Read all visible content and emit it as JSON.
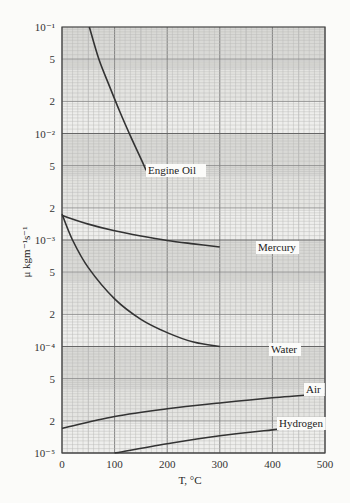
{
  "chart_data": {
    "type": "line",
    "title": "",
    "xlabel": "T, °C",
    "ylabel": "μ kgm⁻¹s⁻¹",
    "xscale": "linear",
    "yscale": "log",
    "xlim": [
      0,
      500
    ],
    "ylim": [
      1e-05,
      0.1
    ],
    "grid": true,
    "legend": "inline labels at curve ends",
    "x_ticks": [
      "0",
      "100",
      "200",
      "300",
      "400",
      "500"
    ],
    "y_ticks": [
      {
        "value": 0.1,
        "label": "10⁻¹"
      },
      {
        "value": 0.05,
        "label": "5"
      },
      {
        "value": 0.02,
        "label": "2"
      },
      {
        "value": 0.01,
        "label": "10⁻²"
      },
      {
        "value": 0.005,
        "label": "5"
      },
      {
        "value": 0.002,
        "label": "2"
      },
      {
        "value": 0.001,
        "label": "10⁻³"
      },
      {
        "value": 0.0005,
        "label": "5"
      },
      {
        "value": 0.0002,
        "label": "2"
      },
      {
        "value": 0.0001,
        "label": "10⁻⁴"
      },
      {
        "value": 5e-05,
        "label": "5"
      },
      {
        "value": 2e-05,
        "label": "2"
      },
      {
        "value": 1e-05,
        "label": "10⁻⁵"
      }
    ],
    "series": [
      {
        "name": "Engine Oil",
        "x": [
          52,
          70,
          90,
          110,
          130,
          150,
          160
        ],
        "y": [
          0.1,
          0.05,
          0.028,
          0.016,
          0.0095,
          0.0058,
          0.0045
        ]
      },
      {
        "name": "Mercury",
        "x": [
          0,
          50,
          100,
          150,
          200,
          250,
          300
        ],
        "y": [
          0.0017,
          0.00141,
          0.00122,
          0.00109,
          0.00099,
          0.00092,
          0.00086
        ]
      },
      {
        "name": "Water",
        "x": [
          0,
          20,
          50,
          100,
          150,
          200,
          250,
          300
        ],
        "y": [
          0.00175,
          0.001,
          0.00055,
          0.00028,
          0.00018,
          0.000135,
          0.00011,
          0.0001
        ]
      },
      {
        "name": "Air",
        "x": [
          0,
          100,
          200,
          300,
          400,
          500
        ],
        "y": [
          1.7e-05,
          2.2e-05,
          2.6e-05,
          2.95e-05,
          3.3e-05,
          3.6e-05
        ]
      },
      {
        "name": "Hydrogen",
        "x": [
          100,
          200,
          300,
          400,
          500
        ],
        "y": [
          1e-05,
          1.22e-05,
          1.45e-05,
          1.65e-05,
          1.85e-05
        ]
      }
    ]
  },
  "labels": {
    "engine_oil": "Engine Oil",
    "mercury": "Mercury",
    "water": "Water",
    "air": "Air",
    "hydrogen": "Hydrogen",
    "xlabel": "T, °C",
    "ylabel": "μ kgm⁻¹s⁻¹"
  }
}
